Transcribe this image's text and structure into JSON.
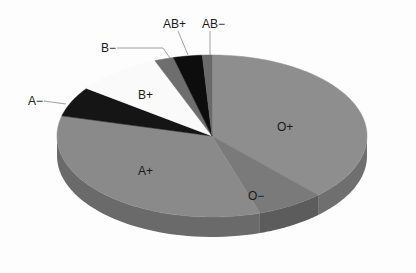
{
  "chart_data": {
    "type": "pie",
    "style": "3d",
    "title": "",
    "start_angle_deg": 0,
    "direction": "clockwise",
    "categories": [
      "O+",
      "O−",
      "A+",
      "A−",
      "B+",
      "B−",
      "AB+",
      "AB−"
    ],
    "values": [
      38,
      7,
      34,
      6,
      9,
      2,
      3,
      1
    ],
    "colors": [
      "#8e8e8e",
      "#7a7a7a",
      "#8a8a8a",
      "#151515",
      "#fafafa",
      "#6e6e6e",
      "#0d0d0d",
      "#6a6a6a"
    ],
    "side_colors": [
      "#6f6f6f",
      "#5c5c5c",
      "#6a6a6a",
      "#0a0a0a",
      "#d8d8d8",
      "#505050",
      "#050505",
      "#4e4e4e"
    ],
    "label_positions": [
      "inside",
      "inside",
      "inside",
      "outside",
      "inside",
      "outside",
      "outside",
      "outside"
    ],
    "legend": "none",
    "grid": false
  },
  "labels": {
    "o_pos": "O+",
    "o_neg": "O−",
    "a_pos": "A+",
    "a_neg": "A−",
    "b_pos": "B+",
    "b_neg": "B−",
    "ab_pos": "AB+",
    "ab_neg": "AB−"
  }
}
